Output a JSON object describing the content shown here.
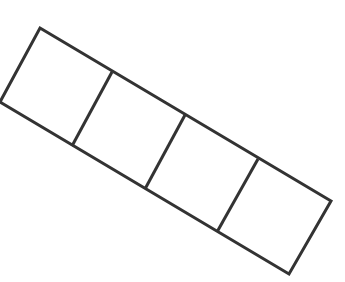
{
  "diagram": {
    "stroke_color": "#333333",
    "fill_color": "#ffffff",
    "square_count": 4,
    "outline": {
      "top_left": [
        40,
        28
      ],
      "top_right": [
        331,
        201
      ],
      "bottom_right": [
        289,
        274
      ],
      "bottom_left": [
        0,
        102
      ]
    },
    "dividers": [
      {
        "top": [
          112,
          72
        ],
        "bottom": [
          72,
          146
        ]
      },
      {
        "top": [
          185,
          115
        ],
        "bottom": [
          145,
          189
        ]
      },
      {
        "top": [
          258,
          159
        ],
        "bottom": [
          217,
          232
        ]
      }
    ]
  }
}
